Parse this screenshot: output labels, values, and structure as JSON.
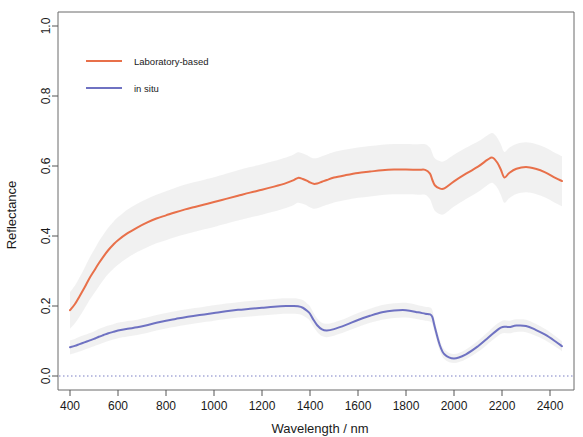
{
  "chart_data": {
    "type": "line",
    "title": "",
    "xlabel": "Wavelength / nm",
    "ylabel": "Reflectance",
    "xlim": [
      350,
      2500
    ],
    "ylim": [
      -0.04,
      1.04
    ],
    "xticks": [
      400,
      600,
      800,
      1000,
      1200,
      1400,
      1600,
      1800,
      2000,
      2200,
      2400
    ],
    "xtick_labels": [
      "400",
      "600",
      "800",
      "1000",
      "1200",
      "1400",
      "1600",
      "1800",
      "2000",
      "2200",
      "2400"
    ],
    "yticks": [
      0.0,
      0.2,
      0.4,
      0.6,
      0.8,
      1.0
    ],
    "ytick_labels": [
      "0.0",
      "0.2",
      "0.4",
      "0.6",
      "0.8",
      "1.0"
    ],
    "grid": false,
    "legend_position": "top-left",
    "reference_line": {
      "y": 0.0,
      "style": "dotted",
      "color": "#7b7fc4"
    },
    "colors": {
      "laboratory": "#e8704a",
      "in_situ": "#6f72c2",
      "band": "#eeeeee"
    },
    "x": [
      400,
      420,
      440,
      460,
      480,
      500,
      520,
      540,
      560,
      580,
      600,
      640,
      680,
      720,
      760,
      800,
      840,
      880,
      920,
      960,
      1000,
      1050,
      1100,
      1150,
      1200,
      1250,
      1300,
      1330,
      1350,
      1370,
      1390,
      1400,
      1415,
      1430,
      1450,
      1470,
      1500,
      1550,
      1600,
      1650,
      1700,
      1750,
      1800,
      1850,
      1880,
      1900,
      1910,
      1920,
      1940,
      1960,
      2000,
      2050,
      2100,
      2140,
      2160,
      2180,
      2195,
      2210,
      2230,
      2260,
      2300,
      2340,
      2380,
      2420,
      2450
    ],
    "series": [
      {
        "name": "Laboratory-based",
        "color": "#e8704a",
        "values": [
          0.188,
          0.205,
          0.228,
          0.252,
          0.278,
          0.3,
          0.322,
          0.342,
          0.36,
          0.375,
          0.388,
          0.408,
          0.424,
          0.438,
          0.45,
          0.459,
          0.468,
          0.476,
          0.483,
          0.49,
          0.497,
          0.506,
          0.515,
          0.524,
          0.532,
          0.541,
          0.551,
          0.559,
          0.566,
          0.563,
          0.557,
          0.553,
          0.549,
          0.55,
          0.555,
          0.56,
          0.567,
          0.574,
          0.58,
          0.584,
          0.588,
          0.59,
          0.59,
          0.589,
          0.589,
          0.578,
          0.56,
          0.545,
          0.536,
          0.536,
          0.556,
          0.578,
          0.598,
          0.618,
          0.624,
          0.61,
          0.59,
          0.567,
          0.58,
          0.592,
          0.597,
          0.592,
          0.582,
          0.567,
          0.557
        ],
        "band_lower": [
          0.135,
          0.15,
          0.17,
          0.192,
          0.216,
          0.236,
          0.256,
          0.275,
          0.292,
          0.306,
          0.318,
          0.338,
          0.354,
          0.367,
          0.379,
          0.388,
          0.397,
          0.405,
          0.412,
          0.419,
          0.426,
          0.435,
          0.444,
          0.453,
          0.461,
          0.47,
          0.48,
          0.488,
          0.495,
          0.492,
          0.486,
          0.482,
          0.478,
          0.479,
          0.484,
          0.489,
          0.496,
          0.503,
          0.509,
          0.513,
          0.517,
          0.519,
          0.519,
          0.518,
          0.518,
          0.505,
          0.487,
          0.472,
          0.463,
          0.463,
          0.484,
          0.506,
          0.526,
          0.546,
          0.552,
          0.538,
          0.518,
          0.495,
          0.508,
          0.52,
          0.525,
          0.52,
          0.51,
          0.495,
          0.485
        ],
        "band_upper": [
          0.24,
          0.258,
          0.282,
          0.308,
          0.336,
          0.36,
          0.384,
          0.405,
          0.424,
          0.44,
          0.454,
          0.476,
          0.492,
          0.506,
          0.518,
          0.528,
          0.538,
          0.547,
          0.554,
          0.561,
          0.568,
          0.578,
          0.588,
          0.597,
          0.605,
          0.614,
          0.624,
          0.632,
          0.639,
          0.636,
          0.63,
          0.626,
          0.622,
          0.623,
          0.628,
          0.633,
          0.64,
          0.647,
          0.653,
          0.657,
          0.661,
          0.663,
          0.663,
          0.662,
          0.662,
          0.652,
          0.636,
          0.622,
          0.614,
          0.614,
          0.632,
          0.652,
          0.67,
          0.688,
          0.694,
          0.681,
          0.662,
          0.64,
          0.652,
          0.663,
          0.668,
          0.663,
          0.653,
          0.638,
          0.628
        ]
      },
      {
        "name": "in situ",
        "color": "#6f72c2",
        "values": [
          0.082,
          0.086,
          0.091,
          0.096,
          0.101,
          0.106,
          0.112,
          0.117,
          0.122,
          0.126,
          0.13,
          0.135,
          0.139,
          0.145,
          0.152,
          0.158,
          0.163,
          0.168,
          0.172,
          0.176,
          0.18,
          0.185,
          0.189,
          0.192,
          0.195,
          0.198,
          0.2,
          0.2,
          0.199,
          0.195,
          0.185,
          0.178,
          0.16,
          0.145,
          0.133,
          0.13,
          0.134,
          0.146,
          0.16,
          0.172,
          0.182,
          0.187,
          0.188,
          0.182,
          0.178,
          0.176,
          0.168,
          0.14,
          0.09,
          0.062,
          0.05,
          0.062,
          0.085,
          0.108,
          0.12,
          0.131,
          0.138,
          0.141,
          0.14,
          0.144,
          0.143,
          0.132,
          0.118,
          0.1,
          0.085
        ],
        "band_lower": [
          0.062,
          0.066,
          0.07,
          0.075,
          0.08,
          0.085,
          0.09,
          0.095,
          0.1,
          0.104,
          0.108,
          0.113,
          0.117,
          0.123,
          0.13,
          0.136,
          0.141,
          0.146,
          0.15,
          0.154,
          0.158,
          0.163,
          0.167,
          0.17,
          0.173,
          0.176,
          0.178,
          0.178,
          0.177,
          0.173,
          0.164,
          0.157,
          0.14,
          0.126,
          0.114,
          0.111,
          0.115,
          0.127,
          0.14,
          0.152,
          0.161,
          0.166,
          0.167,
          0.162,
          0.158,
          0.156,
          0.148,
          0.122,
          0.074,
          0.048,
          0.037,
          0.048,
          0.069,
          0.091,
          0.102,
          0.113,
          0.12,
          0.123,
          0.122,
          0.126,
          0.125,
          0.115,
          0.102,
          0.085,
          0.071
        ],
        "band_upper": [
          0.102,
          0.106,
          0.112,
          0.117,
          0.122,
          0.127,
          0.134,
          0.139,
          0.144,
          0.148,
          0.152,
          0.157,
          0.161,
          0.167,
          0.174,
          0.18,
          0.185,
          0.19,
          0.194,
          0.198,
          0.202,
          0.207,
          0.211,
          0.214,
          0.217,
          0.22,
          0.222,
          0.222,
          0.221,
          0.217,
          0.206,
          0.199,
          0.18,
          0.164,
          0.152,
          0.149,
          0.153,
          0.165,
          0.18,
          0.192,
          0.203,
          0.208,
          0.209,
          0.202,
          0.198,
          0.196,
          0.188,
          0.158,
          0.106,
          0.076,
          0.063,
          0.076,
          0.101,
          0.125,
          0.138,
          0.149,
          0.156,
          0.159,
          0.158,
          0.162,
          0.161,
          0.149,
          0.134,
          0.115,
          0.099
        ]
      }
    ],
    "legend": [
      {
        "label": "Laboratory-based",
        "color": "#e8704a"
      },
      {
        "label": "in situ",
        "color": "#6f72c2"
      }
    ]
  }
}
